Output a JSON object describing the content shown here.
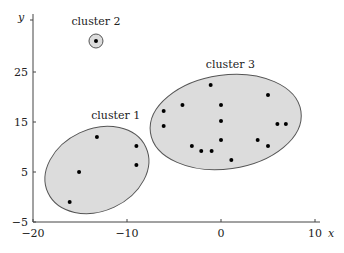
{
  "chart_data": {
    "type": "scatter",
    "title": "",
    "xlabel": "x",
    "ylabel": "y",
    "xlim": [
      -20,
      11
    ],
    "ylim": [
      -5,
      33
    ],
    "xticks": [
      -20,
      -10,
      0,
      10
    ],
    "yticks": [
      -5,
      5,
      15,
      25
    ],
    "xtick_labels": [
      "−20",
      "−10",
      "0",
      "10"
    ],
    "ytick_labels": [
      "−5",
      "5",
      "15",
      "25"
    ],
    "grid": false,
    "legend": null,
    "series": [
      {
        "name": "cluster 1",
        "points": [
          [
            -13.2,
            12.0
          ],
          [
            -9.0,
            10.2
          ],
          [
            -9.0,
            6.4
          ],
          [
            -15.1,
            5.0
          ],
          [
            -16.1,
            -1.0
          ]
        ],
        "ellipse": {
          "cx": -13.2,
          "cy": 5.4,
          "rx_px": 54,
          "ry_px": 41,
          "rotate_deg": -25
        }
      },
      {
        "name": "cluster 2",
        "points": [
          [
            -13.3,
            31.2
          ]
        ],
        "ellipse": {
          "cx": -13.3,
          "cy": 31.2,
          "rx_px": 7,
          "ry_px": 7,
          "rotate_deg": 0
        }
      },
      {
        "name": "cluster 3",
        "points": [
          [
            -1.1,
            22.4
          ],
          [
            -4.1,
            18.4
          ],
          [
            0.0,
            18.4
          ],
          [
            -6.1,
            17.2
          ],
          [
            -6.1,
            14.2
          ],
          [
            0.0,
            15.2
          ],
          [
            0.0,
            11.4
          ],
          [
            -3.1,
            10.2
          ],
          [
            -2.1,
            9.2
          ],
          [
            -1.0,
            9.2
          ],
          [
            1.1,
            7.4
          ],
          [
            5.0,
            20.4
          ],
          [
            6.0,
            14.6
          ],
          [
            6.9,
            14.6
          ],
          [
            3.9,
            11.4
          ],
          [
            5.0,
            10.2
          ]
        ],
        "ellipse": {
          "cx": 0.5,
          "cy": 15.0,
          "rx_px": 76,
          "ry_px": 47,
          "rotate_deg": -8
        }
      }
    ],
    "annotations": [
      {
        "text": "cluster 1",
        "x": -11.2,
        "y": 15.7
      },
      {
        "text": "cluster 2",
        "x": -13.3,
        "y": 34.5
      },
      {
        "text": "cluster 3",
        "x": 1.0,
        "y": 25.8
      }
    ]
  },
  "style": {
    "ellipse_fill": "#dcdcdc",
    "ellipse_stroke": "#555555",
    "point_color": "#000000",
    "axis_color": "#444444"
  }
}
